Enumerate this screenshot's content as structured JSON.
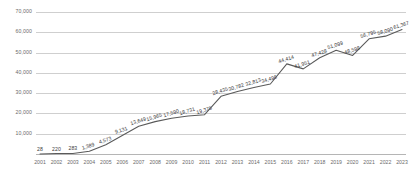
{
  "chart_data": {
    "type": "line",
    "title": "",
    "subtitle": "",
    "xlabel": "",
    "ylabel": "",
    "grid": true,
    "legend": false,
    "ylim": [
      0,
      70000
    ],
    "yticks": [
      10000,
      20000,
      30000,
      40000,
      50000,
      60000,
      70000
    ],
    "ytick_labels": [
      "10,000",
      "20,000",
      "30,000",
      "40,000",
      "50,000",
      "60,000",
      "70,000"
    ],
    "categories": [
      "2001",
      "2002",
      "2003",
      "2004",
      "2005",
      "2006",
      "2007",
      "2008",
      "2009",
      "2010",
      "2011",
      "2012",
      "2013",
      "2014",
      "2015",
      "2016",
      "2017",
      "2018",
      "2019",
      "2020",
      "2021",
      "2022",
      "2023"
    ],
    "values": [
      28,
      220,
      283,
      1389,
      4573,
      9131,
      13649,
      15965,
      17590,
      18731,
      19375,
      28435,
      30782,
      32813,
      34496,
      44414,
      41951,
      47428,
      51099,
      48598,
      56795,
      58090,
      61367
    ],
    "point_labels": [
      "28",
      "220",
      "283",
      "1,389",
      "4,573",
      "9,131",
      "13,649",
      "15,965",
      "17,590",
      "18,731",
      "19,375",
      "28,435",
      "30,782",
      "32,813",
      "34,496",
      "44,414",
      "41,951",
      "47,428",
      "51,099",
      "48,598",
      "56,795",
      "58,090",
      "61,367"
    ],
    "series_color": "#5a5a5a",
    "grid_color": "#cfcfcf",
    "label_color": "#3d3d3d",
    "tick_color": "#6b6b6b"
  }
}
